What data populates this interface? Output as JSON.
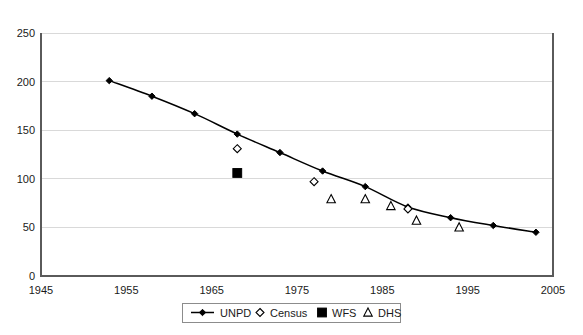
{
  "chart_data": {
    "type": "line",
    "title": "",
    "subtitle": "",
    "xlabel": "",
    "ylabel": "",
    "xlim": [
      1945,
      2005
    ],
    "ylim": [
      0,
      250
    ],
    "xticks": [
      1945,
      1955,
      1965,
      1975,
      1985,
      1995,
      2005
    ],
    "yticks": [
      0,
      50,
      100,
      150,
      200,
      250
    ],
    "xtick_labels": [
      "1945",
      "1955",
      "1965",
      "1975",
      "1985",
      "1995",
      "2005"
    ],
    "ytick_labels": [
      "0",
      "50",
      "100",
      "150",
      "200",
      "250"
    ],
    "grid": "horizontal",
    "legend_position": "bottom-center",
    "series": [
      {
        "name": "UNPD",
        "marker": "filled-diamond",
        "line": true,
        "color": "#000000",
        "points": [
          {
            "x": 1953,
            "y": 201
          },
          {
            "x": 1958,
            "y": 185
          },
          {
            "x": 1963,
            "y": 167
          },
          {
            "x": 1968,
            "y": 146
          },
          {
            "x": 1973,
            "y": 127
          },
          {
            "x": 1978,
            "y": 108
          },
          {
            "x": 1983,
            "y": 92
          },
          {
            "x": 1988,
            "y": 71
          },
          {
            "x": 1993,
            "y": 60
          },
          {
            "x": 1998,
            "y": 52
          },
          {
            "x": 2003,
            "y": 45
          }
        ]
      },
      {
        "name": "Census",
        "marker": "open-diamond",
        "line": false,
        "color": "#000000",
        "points": [
          {
            "x": 1968,
            "y": 131
          },
          {
            "x": 1977,
            "y": 97
          },
          {
            "x": 1988,
            "y": 69
          }
        ]
      },
      {
        "name": "WFS",
        "marker": "filled-square",
        "line": false,
        "color": "#000000",
        "points": [
          {
            "x": 1968,
            "y": 106
          }
        ]
      },
      {
        "name": "DHS",
        "marker": "open-triangle",
        "line": false,
        "color": "#000000",
        "points": [
          {
            "x": 1979,
            "y": 79
          },
          {
            "x": 1983,
            "y": 79
          },
          {
            "x": 1986,
            "y": 72
          },
          {
            "x": 1989,
            "y": 57
          },
          {
            "x": 1994,
            "y": 50
          }
        ]
      }
    ]
  },
  "legend": {
    "entries": [
      {
        "label": "UNPD",
        "marker": "line-filled-diamond"
      },
      {
        "label": "Census",
        "marker": "open-diamond"
      },
      {
        "label": "WFS",
        "marker": "filled-square"
      },
      {
        "label": "DHS",
        "marker": "open-triangle"
      }
    ]
  },
  "colors": {
    "series": "#000000",
    "grid": "#d9d9d9",
    "axis": "#5a5a5a",
    "background": "#ffffff"
  }
}
